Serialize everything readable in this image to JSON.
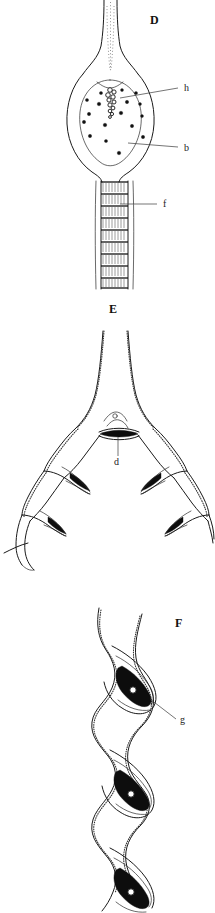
{
  "figure": {
    "background_color": "#ffffff",
    "ink_color": "#111111",
    "width": 215,
    "height": 913,
    "caption_style": "bold serif capitals"
  },
  "panels": [
    {
      "letter": "D",
      "name": "panel-d",
      "subject": "swollen organ with nucleated body, ciliated stalk and segmented ladder-like duct",
      "letter_position": {
        "x": 150,
        "y": 24
      },
      "callouts": [
        {
          "label": "h",
          "name": "callout-h",
          "label_x": 184,
          "label_y": 91,
          "leader": {
            "x1": 178,
            "y1": 88,
            "x2": 120,
            "y2": 98
          },
          "target": "clustered granular mass at apex of body"
        },
        {
          "label": "b",
          "name": "callout-b",
          "label_x": 184,
          "label_y": 151,
          "leader": {
            "x1": 178,
            "y1": 147,
            "x2": 128,
            "y2": 143
          },
          "target": "body wall with scattered nuclei"
        },
        {
          "label": "f",
          "name": "callout-f",
          "label_x": 163,
          "label_y": 207,
          "leader": {
            "x1": 157,
            "y1": 204,
            "x2": 120,
            "y2": 204
          },
          "target": "segmented ladder-like duct"
        }
      ],
      "nuclei_count": 17,
      "ladder_segments": 9
    },
    {
      "letter": "E",
      "name": "panel-e",
      "subject": "bifurcating trunk dividing into two flared recurved branches with dark crescent inclusions",
      "letter_position": {
        "x": 113,
        "y": 313
      },
      "callouts": [
        {
          "label": "d",
          "name": "callout-d",
          "label_x": 116,
          "label_y": 470,
          "leader": {
            "x1": 118,
            "y1": 461,
            "x2": 118,
            "y2": 438
          },
          "target": "dark transverse bar at fork of the branches"
        }
      ],
      "branch_count": 2,
      "lobes_per_branch": 2
    },
    {
      "letter": "F",
      "name": "panel-f",
      "subject": "helically twisted ribbon with three successive dark crescent lobes",
      "letter_position": {
        "x": 175,
        "y": 627
      },
      "callouts": [
        {
          "label": "g",
          "name": "callout-g",
          "label_x": 180,
          "label_y": 723,
          "leader": {
            "x1": 176,
            "y1": 719,
            "x2": 153,
            "y2": 700
          },
          "target": "dark crescent lobe inside spiral turn"
        }
      ],
      "spiral_turns": 3
    }
  ]
}
